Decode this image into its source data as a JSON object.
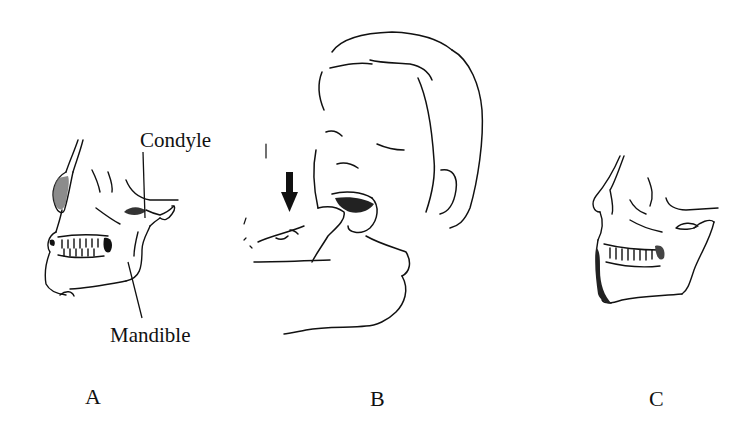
{
  "figure": {
    "panels": [
      {
        "id": "A",
        "label": "A",
        "description": "Lateral skull view with dislocated jaw",
        "annotations": [
          {
            "text": "Condyle"
          },
          {
            "text": "Mandible"
          }
        ]
      },
      {
        "id": "B",
        "label": "B",
        "description": "Reduction maneuver: thumbs pressing down on lower molars",
        "icons": [
          "down-arrow-icon"
        ]
      },
      {
        "id": "C",
        "label": "C",
        "description": "Lateral skull view with jaw restored"
      }
    ],
    "colors": {
      "ink": "#111111",
      "background": "#ffffff",
      "shading": "#555555"
    }
  }
}
